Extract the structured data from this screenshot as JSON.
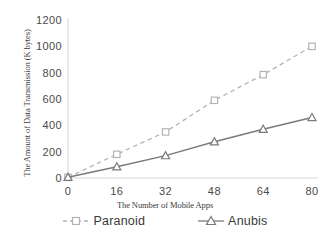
{
  "chart_data": {
    "type": "line",
    "title": "",
    "xlabel": "The Number of Mobile Apps",
    "ylabel": "The Amount of Data Transmission (K bytes)",
    "x": [
      0,
      16,
      32,
      48,
      64,
      80
    ],
    "xticklabels": [
      "0",
      "16",
      "32",
      "48",
      "64",
      "80"
    ],
    "yticklabels": [
      "0",
      "200",
      "400",
      "600",
      "800",
      "1000",
      "1200"
    ],
    "yticks": [
      0,
      200,
      400,
      600,
      800,
      1000,
      1200
    ],
    "xlim": [
      0,
      80
    ],
    "ylim": [
      0,
      1200
    ],
    "grid": false,
    "legend_position": "bottom",
    "series": [
      {
        "name": "Paranoid",
        "values": [
          5,
          180,
          350,
          590,
          785,
          1000
        ],
        "color": "#b4b4b4",
        "linestyle": "dashed",
        "marker": "square"
      },
      {
        "name": "Anubis",
        "values": [
          5,
          85,
          170,
          275,
          370,
          460
        ],
        "color": "#7a7a7a",
        "linestyle": "solid",
        "marker": "triangle"
      }
    ]
  },
  "axes": {
    "y_title": "The Amount of Data Transmission (K bytes)",
    "x_title": "The Number of Mobile Apps",
    "axis_line_color": "#d9d9d9"
  },
  "legend": {
    "items": [
      {
        "label": "Paranoid",
        "marker": "square-marker",
        "color": "#b4b4b4"
      },
      {
        "label": "Anubis",
        "marker": "triangle-marker",
        "color": "#7a7a7a"
      }
    ]
  }
}
